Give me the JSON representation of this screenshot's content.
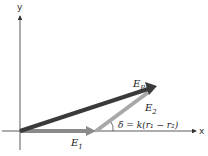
{
  "diagram": {
    "type": "phasor-vector-diagram",
    "axes": {
      "x_label": "x",
      "y_label": "y"
    },
    "vectors": [
      {
        "name": "E1",
        "label": "E",
        "subscript": "1",
        "color": "#8a8a8a"
      },
      {
        "name": "E2",
        "label": "E",
        "subscript": "2",
        "color": "#a5a5a5"
      },
      {
        "name": "EP",
        "label": "E",
        "subscript": "P",
        "color": "#3a3a3a"
      }
    ],
    "angle_label": "δ = k(r₁ − r₂)"
  }
}
